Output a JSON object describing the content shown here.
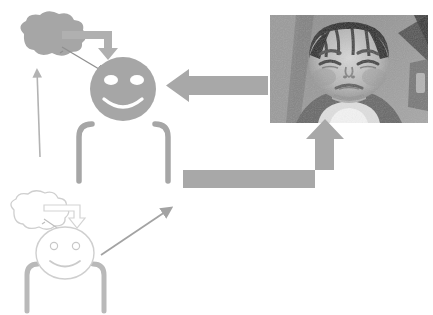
{
  "canvas": {
    "width": 433,
    "height": 315,
    "background": "#ffffff",
    "title": "Emotional contagion diagram: infant distress photo influencing caregiver mental state"
  },
  "palette": {
    "solid_gray": "#a6a6a6",
    "mid_gray": "#999999",
    "arrow_gray": "#a8a8a8",
    "faded_gray": "#d8d8d8",
    "faint_outline": "#cfcfcf",
    "thin_line": "#b3b3b3",
    "white": "#ffffff",
    "photo_dark": "#3a3a3a",
    "photo_mid": "#8a8a8a",
    "photo_light": "#d2d2d2"
  },
  "figures": {
    "primary_person": {
      "name": "observer-figure-active",
      "state": "solid",
      "head": {
        "name": "smiley-head",
        "cx": 123,
        "cy": 89,
        "rx": 33,
        "ry": 32,
        "fill": "#a6a6a6",
        "expression": "smiling",
        "eye_left": {
          "cx": 111,
          "cy": 80,
          "rx": 7,
          "ry": 5
        },
        "eye_right": {
          "cx": 137,
          "cy": 80,
          "rx": 7,
          "ry": 5
        },
        "mouth": "smile-arc"
      },
      "body": {
        "name": "shoulders-brackets",
        "left_bracket": "M 78 180 L 78 136 Q 78 124 90 124",
        "right_bracket": "M 168 180 L 168 136 Q 168 124 156 124",
        "stroke": "#a6a6a6",
        "stroke_width": 5
      },
      "thought_cloud": {
        "name": "thought-cloud-filled",
        "fill": "#a6a6a6",
        "cx": 50,
        "cy": 38
      },
      "cloud_tether": {
        "name": "cloud-tether-line",
        "from": [
          63,
          50
        ],
        "to": [
          100,
          70
        ]
      }
    },
    "secondary_person": {
      "name": "observer-figure-faded",
      "state": "faded-outline",
      "head": {
        "name": "smiley-head-faded",
        "cx": 64,
        "cy": 253,
        "rx": 28,
        "ry": 25,
        "fill": "#ffffff",
        "stroke": "#cfcfcf",
        "expression": "smiling",
        "eye_left": {
          "cx": 54,
          "cy": 246,
          "r": 3.5
        },
        "eye_right": {
          "cx": 76,
          "cy": 246,
          "r": 3.5
        },
        "mouth": "smile-arc"
      },
      "body": {
        "name": "shoulders-brackets-faded",
        "left_bracket": "M 26 310 L 26 274 Q 26 264 36 264",
        "right_bracket": "M 104 310 L 104 274 Q 104 264 94 264",
        "stroke": "#b9b9b9",
        "stroke_width": 5
      },
      "thought_cloud": {
        "name": "thought-cloud-outline",
        "fill": "#ffffff",
        "stroke": "#cfcfcf",
        "cx": 38,
        "cy": 213
      },
      "cloud_tether": {
        "name": "cloud-tether-line-faded",
        "from": [
          48,
          222
        ],
        "to": [
          72,
          238
        ]
      }
    }
  },
  "photo": {
    "name": "infant-distress-photo",
    "alt_description": "Grayscale photograph of a crying infant with eyes squeezed shut, wearing a light bib, seated in a car seat",
    "x": 270,
    "y": 15,
    "width": 158,
    "height": 108,
    "grayscale": true
  },
  "arrows": [
    {
      "name": "arrow-photo-to-head",
      "shape": "straight-left",
      "direction": "left",
      "color": "#a8a8a8",
      "from": [
        268,
        85
      ],
      "to": [
        166,
        85
      ],
      "meaning": "infant face drives observer head state"
    },
    {
      "name": "arrow-body-to-photo",
      "shape": "elbow-right-up",
      "direction": "right-then-up",
      "color": "#a8a8a8",
      "from": [
        183,
        180
      ],
      "to": [
        325,
        124
      ],
      "meaning": "observer body response feeds back to infant"
    },
    {
      "name": "arrow-cloud-to-head",
      "shape": "elbow-right-down",
      "direction": "right-then-down",
      "color": "#b0b0b0",
      "from": [
        64,
        36
      ],
      "to": [
        120,
        57
      ],
      "meaning": "thought content shapes facial expression"
    },
    {
      "name": "arrow-cloud-to-head-faded",
      "shape": "elbow-right-down",
      "direction": "right-then-down",
      "color": "#d4d4d4",
      "from": [
        48,
        210
      ],
      "to": [
        82,
        231
      ],
      "meaning": "faded: thought content shapes facial expression"
    },
    {
      "name": "arrow-thin-up",
      "shape": "thin-vertical",
      "direction": "up",
      "color": "#b3b3b3",
      "from": [
        40,
        157
      ],
      "to": [
        37,
        68
      ],
      "meaning": "lower state rises to upper mental state"
    },
    {
      "name": "arrow-diagonal-up-right",
      "shape": "thin-diagonal",
      "direction": "up-right",
      "color": "#a3a3a3",
      "from": [
        103,
        253
      ],
      "to": [
        172,
        207
      ],
      "meaning": "lower figure body feeds upper figure body"
    }
  ]
}
